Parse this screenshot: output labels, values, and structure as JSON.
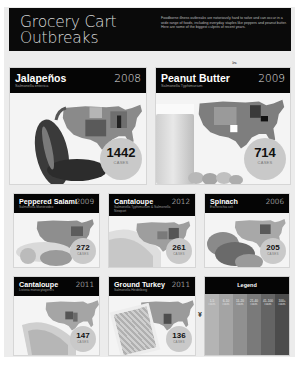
{
  "header": {
    "title": "Grocery Cart Outbreaks",
    "description": "Foodborne illness outbreaks are notoriously hard to solve and can occur in a wide range of foods, including everyday staples like peppers and peanut butter. Here are some of the biggest culprits of recent years."
  },
  "scissors_icon": "✂",
  "outbreaks": [
    {
      "food": "Jalapeños",
      "year": "2008",
      "pathogen": "Salmonella enterica",
      "cases": "1442",
      "cases_label": "CASES"
    },
    {
      "food": "Peanut Butter",
      "year": "2009",
      "pathogen": "Salmonella Typhimurium",
      "cases": "714",
      "cases_label": "CASES"
    },
    {
      "food": "Peppered Salami",
      "year": "2009",
      "pathogen": "Salmonella Montevideo",
      "cases": "272",
      "cases_label": "CASES"
    },
    {
      "food": "Cantaloupe",
      "year": "2012",
      "pathogen": "Salmonella Typhimurium & Salmonella Newport",
      "cases": "261",
      "cases_label": "CASES"
    },
    {
      "food": "Spinach",
      "year": "2006",
      "pathogen": "Escherichia coli",
      "cases": "205",
      "cases_label": "CASES"
    },
    {
      "food": "Cantaloupe",
      "year": "2011",
      "pathogen": "Listeria monocytogenes",
      "cases": "147",
      "cases_label": "CASES"
    },
    {
      "food": "Ground Turkey",
      "year": "2011",
      "pathogen": "Salmonella Heidelberg",
      "cases": "136",
      "cases_label": "CASES"
    }
  ],
  "legend": {
    "title": "Legend",
    "items": [
      {
        "range": "1-5",
        "unit": "cases",
        "color": "#b4b4b4"
      },
      {
        "range": "6-10",
        "unit": "cases",
        "color": "#a4a4a4"
      },
      {
        "range": "11-20",
        "unit": "cases",
        "color": "#909090"
      },
      {
        "range": "21-40",
        "unit": "cases",
        "color": "#7a7a7a"
      },
      {
        "range": "41-100",
        "unit": "cases",
        "color": "#646464"
      },
      {
        "range": "100+",
        "unit": "cases",
        "color": "#4c4c4c"
      }
    ]
  },
  "colors": {
    "header_bg": "#0a0a0a",
    "page_bg": "#ececec",
    "badge_bg": "#c9c9c9"
  }
}
